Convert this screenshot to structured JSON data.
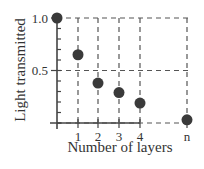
{
  "chart_data": {
    "type": "scatter",
    "title": "",
    "xlabel": "Number of layers",
    "ylabel": "Light transmitted",
    "x_tick_labels": [
      "1",
      "2",
      "3",
      "4",
      "n"
    ],
    "y_tick_labels": [
      "1.0",
      "0.5"
    ],
    "ylim": [
      0,
      1.0
    ],
    "grid": "dashed at x ticks and y = 0.5, 1.0",
    "legend": null,
    "points": [
      {
        "x": "0",
        "y": 1.0
      },
      {
        "x": "1",
        "y": 0.65
      },
      {
        "x": "2",
        "y": 0.38
      },
      {
        "x": "3",
        "y": 0.29
      },
      {
        "x": "4",
        "y": 0.19
      },
      {
        "x": "n",
        "y": 0.03
      }
    ]
  },
  "colors": {
    "marker": "#3a3a3a",
    "axis": "#444444",
    "grid": "#555555"
  }
}
